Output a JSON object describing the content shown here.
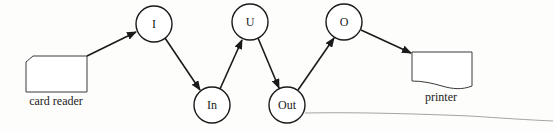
{
  "diagram": {
    "type": "flow",
    "colors": {
      "stroke": "#1a1a1a",
      "device_stroke": "#3a3a3a",
      "text": "#222222",
      "background": "#fdfdfc",
      "pencil": "#9a9a9a"
    },
    "devices": {
      "card_reader": {
        "label": "card reader",
        "shape": "punched-card"
      },
      "printer": {
        "label": "printer",
        "shape": "document"
      }
    },
    "nodes": [
      {
        "id": "I",
        "label": "I"
      },
      {
        "id": "In",
        "label": "In"
      },
      {
        "id": "U",
        "label": "U"
      },
      {
        "id": "Out",
        "label": "Out"
      },
      {
        "id": "O",
        "label": "O"
      }
    ],
    "edges": [
      {
        "from": "card reader",
        "to": "I"
      },
      {
        "from": "I",
        "to": "In"
      },
      {
        "from": "In",
        "to": "U"
      },
      {
        "from": "U",
        "to": "Out"
      },
      {
        "from": "Out",
        "to": "O"
      },
      {
        "from": "O",
        "to": "printer"
      }
    ]
  }
}
